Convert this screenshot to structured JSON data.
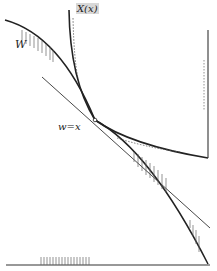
{
  "figure": {
    "labels": {
      "w": "W",
      "xx": "X(x)",
      "wx": "w=x"
    },
    "colors": {
      "stroke": "#2a2a2a",
      "hatch": "#555555",
      "label_bg": "#d8d8d8"
    }
  }
}
